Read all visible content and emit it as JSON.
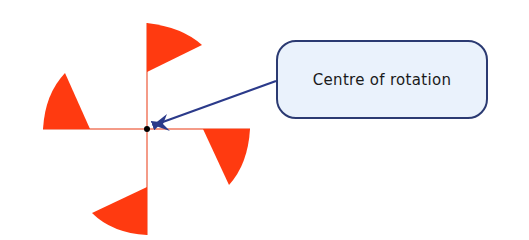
{
  "diagram": {
    "center": {
      "x": 147,
      "y": 129
    },
    "colors": {
      "sector_fill": "#ff3a10",
      "axis_line": "#f07a60",
      "center_dot": "#000000",
      "arrow": "#2b3a8a",
      "callout_fill": "#eaf2fc",
      "callout_border": "#2b3a72"
    },
    "axes": {
      "horizontal": {
        "x1": 43,
        "y1": 129,
        "x2": 250,
        "y2": 129
      },
      "vertical": {
        "x1": 147,
        "y1": 23,
        "x2": 147,
        "y2": 235
      }
    },
    "sectors": [
      {
        "name": "top",
        "path": "M147,23 Q182,27 202,45 L147,72 Z"
      },
      {
        "name": "right",
        "path": "M250,129 Q248,164 229,185 L203,129 Z"
      },
      {
        "name": "bottom",
        "path": "M147,235 Q112,233 92,213 L147,187 Z"
      },
      {
        "name": "left",
        "path": "M43,129 Q45,94 65,73 L90,129 Z"
      }
    ],
    "arrow": {
      "x1": 276,
      "y1": 81,
      "x2": 156,
      "y2": 124
    },
    "callout": {
      "label": "Centre of rotation"
    }
  }
}
